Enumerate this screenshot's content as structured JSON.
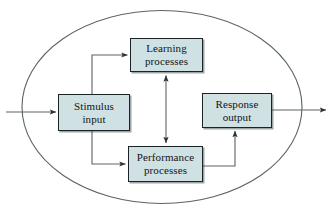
{
  "diagram": {
    "type": "flow-diagram",
    "boundary": {
      "shape": "ellipse",
      "label": "organism-boundary",
      "stroke_color": "#555f63",
      "fill": "none",
      "center_x": 162,
      "center_y": 107,
      "radius_x": 141,
      "radius_y": 97
    },
    "style": {
      "box_fill": "#cfe1e3",
      "box_border": "#1a2326",
      "connector_color": "#555f63",
      "text_color": "#111518",
      "background": "#ffffff"
    },
    "nodes": [
      {
        "id": "learning",
        "name": "learning-processes",
        "lines": [
          "Learning",
          "processes"
        ],
        "x": 130,
        "y": 38,
        "width": 73,
        "height": 34
      },
      {
        "id": "stimulus",
        "name": "stimulus-input",
        "lines": [
          "Stimulus",
          "input"
        ],
        "x": 58,
        "y": 94,
        "width": 72,
        "height": 37
      },
      {
        "id": "response",
        "name": "response-output",
        "lines": [
          "Response",
          "output"
        ],
        "x": 202,
        "y": 93,
        "width": 70,
        "height": 35
      },
      {
        "id": "performance",
        "name": "performance-processes",
        "lines": [
          "Performance",
          "processes"
        ],
        "x": 128,
        "y": 146,
        "width": 75,
        "height": 36
      }
    ],
    "connectors": [
      {
        "id": "input-arrow",
        "name": "external-input-arrow",
        "from": "external",
        "to": "stimulus",
        "arrowheads": "end",
        "label": ""
      },
      {
        "id": "stimulus-to-learning",
        "name": "stimulus-to-learning-arrow",
        "from": "stimulus",
        "to": "learning",
        "arrowheads": "end",
        "label": ""
      },
      {
        "id": "stimulus-to-performance",
        "name": "stimulus-to-performance-arrow",
        "from": "stimulus",
        "to": "performance",
        "arrowheads": "end",
        "label": ""
      },
      {
        "id": "learning-performance",
        "name": "learning-performance-bidirectional-arrow",
        "from": "learning",
        "to": "performance",
        "arrowheads": "both",
        "label": ""
      },
      {
        "id": "performance-to-response",
        "name": "performance-to-response-arrow",
        "from": "performance",
        "to": "response",
        "arrowheads": "end",
        "label": ""
      },
      {
        "id": "output-arrow",
        "name": "external-output-arrow",
        "from": "response",
        "to": "external",
        "arrowheads": "end",
        "label": ""
      }
    ]
  }
}
